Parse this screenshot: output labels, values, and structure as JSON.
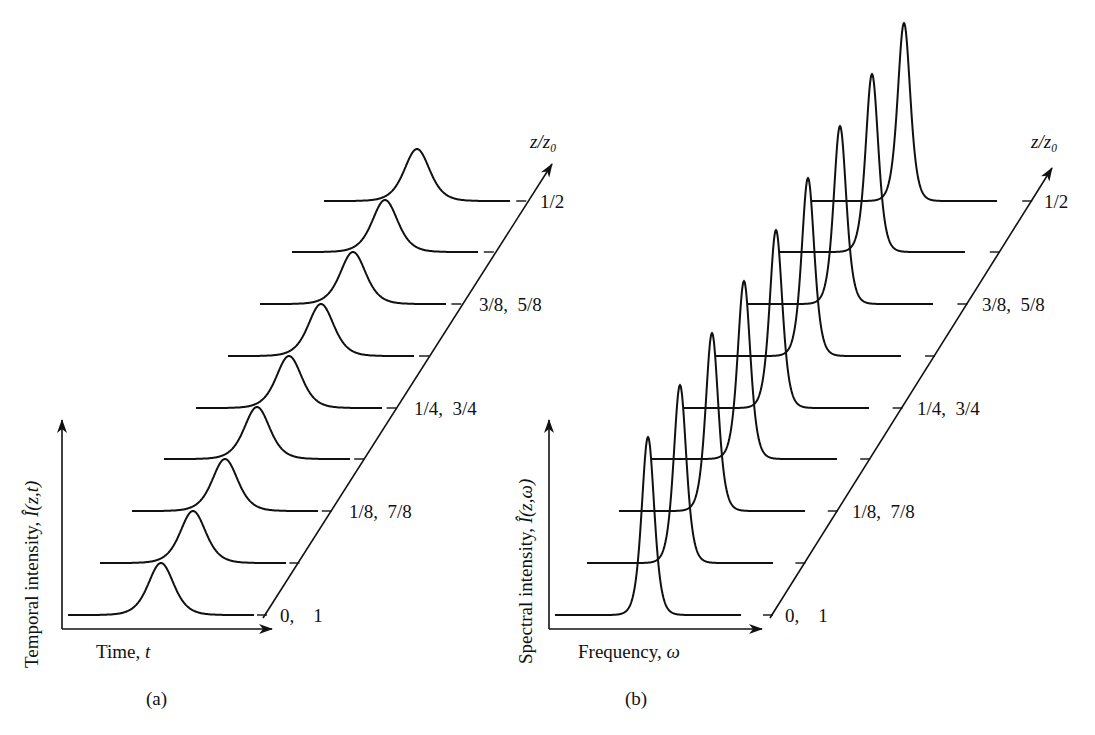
{
  "figure": {
    "panels": [
      {
        "id": "a",
        "caption": "(a)",
        "x_axis_label": "Time, ",
        "x_axis_var": "t",
        "y_axis_label": "Temporal intensity, ",
        "y_axis_var": "Î(z,t)",
        "z_axis_label": "z/z₀"
      },
      {
        "id": "b",
        "caption": "(b)",
        "x_axis_label": "Frequency, ",
        "x_axis_var": "ω",
        "y_axis_label": "Spectral intensity, ",
        "y_axis_var": "Î(z,ω)",
        "z_axis_label": "z/z₀"
      }
    ],
    "z_tick_labels": [
      "0,    1",
      "",
      "1/8,  7/8",
      "",
      "1/4,  3/4",
      "",
      "3/8,  5/8",
      "",
      "1/2"
    ]
  },
  "chart_data": [
    {
      "type": "line",
      "title": "(a) Temporal intensity evolution (waterfall)",
      "xlabel": "Time, t",
      "ylabel": "Temporal intensity, Î(z,t)",
      "zlabel": "z/z₀",
      "z_ticks": [
        "0, 1",
        "",
        "1/8, 7/8",
        "",
        "1/4, 3/4",
        "",
        "3/8, 5/8",
        "",
        "1/2"
      ],
      "series": [
        {
          "name": "z/z0 = 0, 1",
          "peak_relative_height": 1.0,
          "relative_width": 1.0
        },
        {
          "name": "z/z0 step 2",
          "peak_relative_height": 1.0,
          "relative_width": 1.0
        },
        {
          "name": "z/z0 = 1/8, 7/8",
          "peak_relative_height": 1.0,
          "relative_width": 1.0
        },
        {
          "name": "z/z0 step 4",
          "peak_relative_height": 1.0,
          "relative_width": 1.0
        },
        {
          "name": "z/z0 = 1/4, 3/4",
          "peak_relative_height": 1.0,
          "relative_width": 1.0
        },
        {
          "name": "z/z0 step 6",
          "peak_relative_height": 1.0,
          "relative_width": 1.0
        },
        {
          "name": "z/z0 = 3/8, 5/8",
          "peak_relative_height": 1.0,
          "relative_width": 1.0
        },
        {
          "name": "z/z0 step 8",
          "peak_relative_height": 1.0,
          "relative_width": 1.0
        },
        {
          "name": "z/z0 = 1/2",
          "peak_relative_height": 1.0,
          "relative_width": 1.0
        }
      ],
      "grid": false,
      "legend": "none"
    },
    {
      "type": "line",
      "title": "(b) Spectral intensity evolution (waterfall)",
      "xlabel": "Frequency, ω",
      "ylabel": "Spectral intensity, Î(z,ω)",
      "zlabel": "z/z₀",
      "z_ticks": [
        "0, 1",
        "",
        "1/8, 7/8",
        "",
        "1/4, 3/4",
        "",
        "3/8, 5/8",
        "",
        "1/2"
      ],
      "series": [
        {
          "name": "z/z0 = 0, 1",
          "peak_relative_height": 1.0,
          "relative_width": 0.3
        },
        {
          "name": "z/z0 step 2",
          "peak_relative_height": 1.0,
          "relative_width": 0.3
        },
        {
          "name": "z/z0 = 1/8, 7/8",
          "peak_relative_height": 1.0,
          "relative_width": 0.3
        },
        {
          "name": "z/z0 step 4",
          "peak_relative_height": 1.0,
          "relative_width": 0.3
        },
        {
          "name": "z/z0 = 1/4, 3/4",
          "peak_relative_height": 1.0,
          "relative_width": 0.3
        },
        {
          "name": "z/z0 step 6",
          "peak_relative_height": 1.0,
          "relative_width": 0.3
        },
        {
          "name": "z/z0 = 3/8, 5/8",
          "peak_relative_height": 1.0,
          "relative_width": 0.3
        },
        {
          "name": "z/z0 step 8",
          "peak_relative_height": 1.0,
          "relative_width": 0.3
        },
        {
          "name": "z/z0 = 1/2",
          "peak_relative_height": 1.0,
          "relative_width": 0.3
        }
      ],
      "grid": false,
      "legend": "none"
    }
  ]
}
